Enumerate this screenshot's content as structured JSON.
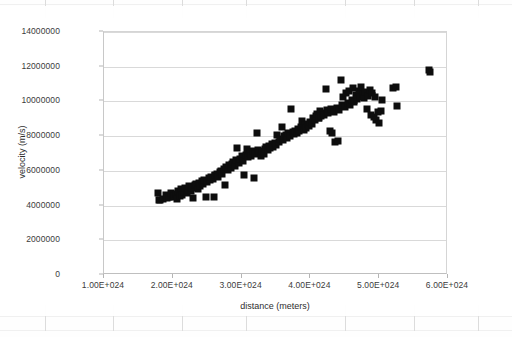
{
  "app": {
    "context": "spreadsheet-embedded-chart"
  },
  "chart_data": {
    "type": "scatter",
    "title": "",
    "xlabel": "distance (meters)",
    "ylabel": "velocity (m/s)",
    "xlim": [
      1e+24,
      6e+24
    ],
    "ylim": [
      0,
      14000000
    ],
    "grid": true,
    "legend": false,
    "marker_color": "#0d0d0d",
    "trend_color": "#8a8a8a",
    "gridline_color": "#d9d9d9",
    "xticks": [
      "1.00E+024",
      "2.00E+024",
      "3.00E+024",
      "4.00E+024",
      "5.00E+024",
      "6.00E+024"
    ],
    "xtick_values": [
      1e+24,
      2e+24,
      3e+24,
      4e+24,
      5e+24,
      6e+24
    ],
    "yticks": [
      "0",
      "2000000",
      "4000000",
      "6000000",
      "8000000",
      "10000000",
      "12000000",
      "14000000"
    ],
    "ytick_values": [
      0,
      2000000,
      4000000,
      6000000,
      8000000,
      10000000,
      12000000,
      14000000
    ],
    "series": [
      {
        "name": "velocity vs distance",
        "marker": "square",
        "points": [
          [
            1.78e+24,
            4740000
          ],
          [
            1.8e+24,
            4300000
          ],
          [
            1.82e+24,
            4320000
          ],
          [
            1.86e+24,
            4380000
          ],
          [
            1.9e+24,
            4600000
          ],
          [
            1.92e+24,
            4420000
          ],
          [
            1.95e+24,
            4500000
          ],
          [
            1.98e+24,
            4720000
          ],
          [
            2e+24,
            4480000
          ],
          [
            2.02e+24,
            4540000
          ],
          [
            2.05e+24,
            4660000
          ],
          [
            2.06e+24,
            4400000
          ],
          [
            2.08e+24,
            4820000
          ],
          [
            2.1e+24,
            4560000
          ],
          [
            2.12e+24,
            4980000
          ],
          [
            2.14e+24,
            4620000
          ],
          [
            2.16e+24,
            4760000
          ],
          [
            2.18e+24,
            5040000
          ],
          [
            2.2e+24,
            4700000
          ],
          [
            2.22e+24,
            4880000
          ],
          [
            2.24e+24,
            5120000
          ],
          [
            2.26e+24,
            4820000
          ],
          [
            2.28e+24,
            5020000
          ],
          [
            2.3e+24,
            4460000
          ],
          [
            2.32e+24,
            5180000
          ],
          [
            2.34e+24,
            5260000
          ],
          [
            2.36e+24,
            4980000
          ],
          [
            2.38e+24,
            5320000
          ],
          [
            2.4e+24,
            5140000
          ],
          [
            2.42e+24,
            5420000
          ],
          [
            2.44e+24,
            5240000
          ],
          [
            2.46e+24,
            5500000
          ],
          [
            2.48e+24,
            4480000
          ],
          [
            2.5e+24,
            5380000
          ],
          [
            2.52e+24,
            5580000
          ],
          [
            2.54e+24,
            5460000
          ],
          [
            2.56e+24,
            5660000
          ],
          [
            2.58e+24,
            5540000
          ],
          [
            2.6e+24,
            4480000
          ],
          [
            2.62e+24,
            5760000
          ],
          [
            2.64e+24,
            5840000
          ],
          [
            2.66e+24,
            5640000
          ],
          [
            2.68e+24,
            5920000
          ],
          [
            2.7e+24,
            6020000
          ],
          [
            2.72e+24,
            5800000
          ],
          [
            2.74e+24,
            6120000
          ],
          [
            2.76e+24,
            5180000
          ],
          [
            2.78e+24,
            6240000
          ],
          [
            2.8e+24,
            6060000
          ],
          [
            2.82e+24,
            6340000
          ],
          [
            2.84e+24,
            6180000
          ],
          [
            2.86e+24,
            6420000
          ],
          [
            2.88e+24,
            6500000
          ],
          [
            2.9e+24,
            6280000
          ],
          [
            2.92e+24,
            6600000
          ],
          [
            2.94e+24,
            7320000
          ],
          [
            2.96e+24,
            6480000
          ],
          [
            2.98e+24,
            6700000
          ],
          [
            3e+24,
            6840000
          ],
          [
            3.02e+24,
            6560000
          ],
          [
            3.04e+24,
            5780000
          ],
          [
            3.06e+24,
            6920000
          ],
          [
            3.08e+24,
            7280000
          ],
          [
            3.1e+24,
            6780000
          ],
          [
            3.12e+24,
            7020000
          ],
          [
            3.14e+24,
            6880000
          ],
          [
            3.16e+24,
            7120000
          ],
          [
            3.18e+24,
            5600000
          ],
          [
            3.2e+24,
            6960000
          ],
          [
            3.22e+24,
            8200000
          ],
          [
            3.24e+24,
            7220000
          ],
          [
            3.26e+24,
            7060000
          ],
          [
            3.28e+24,
            6880000
          ],
          [
            3.3e+24,
            7140000
          ],
          [
            3.32e+24,
            7000000
          ],
          [
            3.34e+24,
            7280000
          ],
          [
            3.36e+24,
            7360000
          ],
          [
            3.38e+24,
            7180000
          ],
          [
            3.4e+24,
            7440000
          ],
          [
            3.42e+24,
            7300000
          ],
          [
            3.44e+24,
            7520000
          ],
          [
            3.46e+24,
            7400000
          ],
          [
            3.48e+24,
            7600000
          ],
          [
            3.5e+24,
            7480000
          ],
          [
            3.52e+24,
            8060000
          ],
          [
            3.54e+24,
            7680000
          ],
          [
            3.56e+24,
            7860000
          ],
          [
            3.58e+24,
            8520000
          ],
          [
            3.6e+24,
            7760000
          ],
          [
            3.62e+24,
            7980000
          ],
          [
            3.64e+24,
            8080000
          ],
          [
            3.66e+24,
            7900000
          ],
          [
            3.68e+24,
            8160000
          ],
          [
            3.7e+24,
            8020000
          ],
          [
            3.72e+24,
            9560000
          ],
          [
            3.74e+24,
            8240000
          ],
          [
            3.76e+24,
            8100000
          ],
          [
            3.78e+24,
            8320000
          ],
          [
            3.8e+24,
            8180000
          ],
          [
            3.82e+24,
            8420000
          ],
          [
            3.84e+24,
            8280000
          ],
          [
            3.86e+24,
            8500000
          ],
          [
            3.88e+24,
            8900000
          ],
          [
            3.9e+24,
            8380000
          ],
          [
            3.92e+24,
            8620000
          ],
          [
            3.94e+24,
            8480000
          ],
          [
            3.96e+24,
            8720000
          ],
          [
            3.98e+24,
            8580000
          ],
          [
            4e+24,
            8820000
          ],
          [
            4.02e+24,
            8680000
          ],
          [
            4.04e+24,
            9060000
          ],
          [
            4.06e+24,
            8920000
          ],
          [
            4.08e+24,
            9180000
          ],
          [
            4.1e+24,
            9280000
          ],
          [
            4.12e+24,
            9060000
          ],
          [
            4.14e+24,
            9420000
          ],
          [
            4.16e+24,
            9180000
          ],
          [
            4.18e+24,
            9360000
          ],
          [
            4.2e+24,
            9240000
          ],
          [
            4.22e+24,
            10700000
          ],
          [
            4.24e+24,
            9480000
          ],
          [
            4.26e+24,
            9320000
          ],
          [
            4.28e+24,
            8280000
          ],
          [
            4.3e+24,
            9560000
          ],
          [
            4.32e+24,
            8160000
          ],
          [
            4.34e+24,
            9400000
          ],
          [
            4.36e+24,
            7680000
          ],
          [
            4.38e+24,
            9640000
          ],
          [
            4.4e+24,
            7740000
          ],
          [
            4.42e+24,
            9520000
          ],
          [
            4.44e+24,
            11260000
          ],
          [
            4.46e+24,
            9780000
          ],
          [
            4.48e+24,
            10260000
          ],
          [
            4.5e+24,
            9680000
          ],
          [
            4.52e+24,
            10480000
          ],
          [
            4.54e+24,
            9900000
          ],
          [
            4.56e+24,
            10580000
          ],
          [
            4.58e+24,
            9820000
          ],
          [
            4.6e+24,
            10060000
          ],
          [
            4.62e+24,
            10800000
          ],
          [
            4.64e+24,
            9960000
          ],
          [
            4.66e+24,
            10380000
          ],
          [
            4.68e+24,
            10140000
          ],
          [
            4.7e+24,
            10620000
          ],
          [
            4.72e+24,
            10280000
          ],
          [
            4.74e+24,
            10860000
          ],
          [
            4.76e+24,
            10420000
          ],
          [
            4.78e+24,
            10180000
          ],
          [
            4.8e+24,
            10540000
          ],
          [
            4.82e+24,
            9560000
          ],
          [
            4.84e+24,
            10320000
          ],
          [
            4.86e+24,
            10680000
          ],
          [
            4.88e+24,
            9240000
          ],
          [
            4.9e+24,
            10460000
          ],
          [
            4.92e+24,
            9080000
          ],
          [
            4.94e+24,
            10240000
          ],
          [
            4.96e+24,
            8920000
          ],
          [
            4.98e+24,
            9380000
          ],
          [
            5e+24,
            8780000
          ],
          [
            5.02e+24,
            9460000
          ],
          [
            5.04e+24,
            10060000
          ],
          [
            5.2e+24,
            10780000
          ],
          [
            5.24e+24,
            10820000
          ],
          [
            5.26e+24,
            9760000
          ],
          [
            5.72e+24,
            11800000
          ],
          [
            5.74e+24,
            11720000
          ]
        ]
      },
      {
        "name": "trendline-points",
        "marker": "small-square",
        "color": "#8a8a8a",
        "points": [
          [
            1.8e+24,
            4300000
          ],
          [
            2.06e+24,
            4780000
          ],
          [
            2.32e+24,
            5300000
          ],
          [
            2.58e+24,
            5820000
          ],
          [
            2.84e+24,
            6340000
          ],
          [
            3.1e+24,
            6880000
          ],
          [
            3.36e+24,
            7340000
          ],
          [
            3.62e+24,
            7860000
          ],
          [
            3.88e+24,
            8400000
          ],
          [
            4.14e+24,
            8920000
          ],
          [
            4.4e+24,
            9440000
          ],
          [
            4.66e+24,
            9980000
          ],
          [
            4.92e+24,
            10420000
          ],
          [
            5.22e+24,
            10800000
          ],
          [
            5.73e+24,
            11760000
          ]
        ]
      }
    ]
  }
}
